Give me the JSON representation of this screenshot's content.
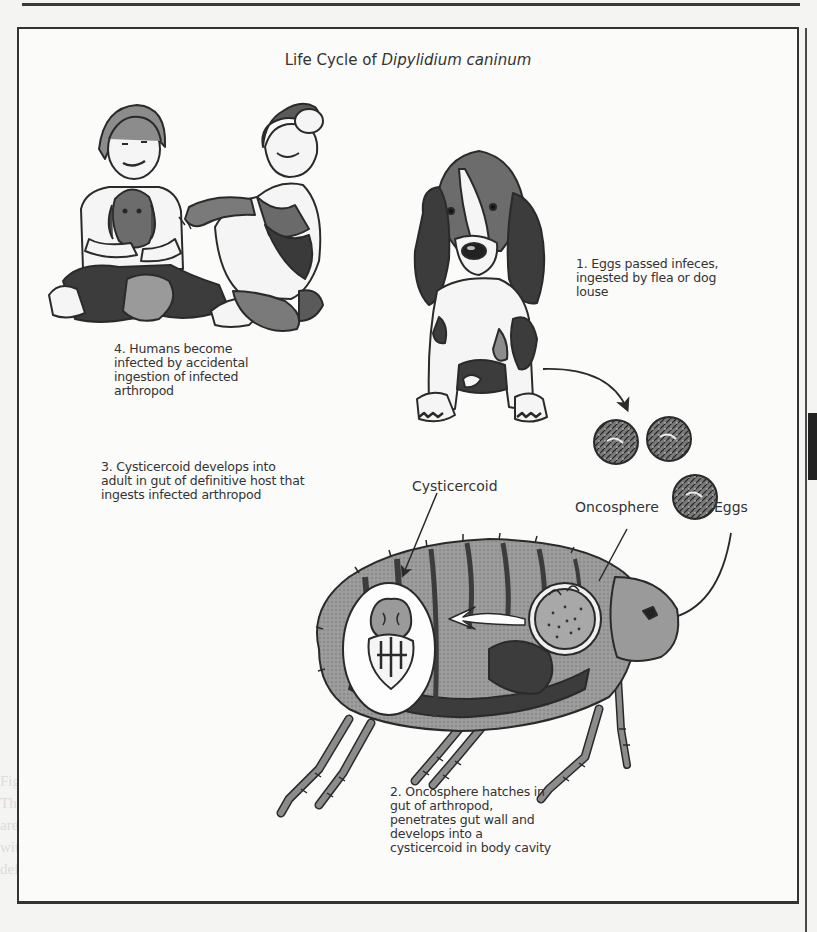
{
  "figure": {
    "title_prefix": "Life Cycle of ",
    "title_species": "Dipylidium caninum",
    "steps": [
      {
        "id": 1,
        "lines": [
          "1. Eggs passed infeces,",
          "ingested by flea or dog",
          "louse"
        ]
      },
      {
        "id": 2,
        "lines": [
          "2. Oncosphere hatches in",
          "gut of arthropod,",
          "penetrates gut wall and",
          "develops into a",
          "cysticercoid in body cavity"
        ]
      },
      {
        "id": 3,
        "lines": [
          "3. Cysticercoid develops into",
          "adult in gut of definitive host that",
          "ingests infected arthropod"
        ]
      },
      {
        "id": 4,
        "lines": [
          "4. Humans become",
          "infected by accidental",
          "ingestion of infected",
          "arthropod"
        ]
      }
    ],
    "callouts": {
      "cysticercoid": "Cysticercoid",
      "oncosphere": "Oncosphere",
      "eggs": "Eggs"
    },
    "illustrations": [
      "children-with-puppy",
      "basset-hound-puppy",
      "tapeworm-eggs",
      "flea-with-cutaway"
    ],
    "colors": {
      "ink": "#2a2a2a",
      "mid_gray": "#8c8c8c",
      "light_gray": "#b8b8b8",
      "dark_gray": "#3c3c3c",
      "paper": "#fbfbfa"
    }
  },
  "page": {
    "ghost_lines": [
      "Figure 1. Life cycle of Dipylidium caninum showing the intermediate flea host.",
      "The gravid proglottids are passed in the feces of the definitive host and the eggs",
      "are ingested by larval fleas or lice; the oncosphere develops into a cysticercoid",
      "within the body cavity of the insect as it matures into the adult stage and the",
      "definitive host is infected by ingestion of the adult flea or louse."
    ]
  }
}
